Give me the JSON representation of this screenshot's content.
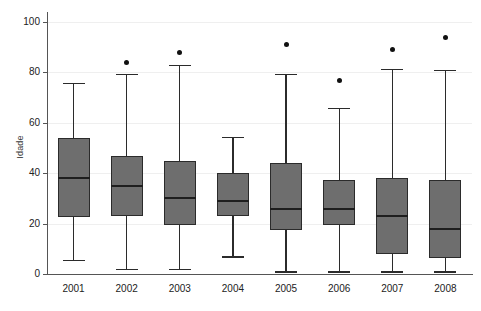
{
  "chart_data": {
    "type": "box",
    "title": "",
    "xlabel": "",
    "ylabel": "Idade",
    "categories": [
      "2001",
      "2002",
      "2003",
      "2004",
      "2005",
      "2006",
      "2007",
      "2008"
    ],
    "ylim": [
      0,
      104
    ],
    "ytick_labels": [
      "0",
      "20",
      "40",
      "60",
      "80",
      "100"
    ],
    "ytick_values": [
      0,
      20,
      40,
      60,
      80,
      100
    ],
    "grid": true,
    "grid_axis": "y",
    "legend": "none",
    "box_color": "#6e6e6e",
    "line_color": "#2b2b2b",
    "outlier_color": "#111111",
    "boxes": [
      {
        "category": "2001",
        "whisker_low": 5.5,
        "q1": 22.5,
        "median": 38.0,
        "q3": 54.0,
        "whisker_high": 76.0,
        "outliers": []
      },
      {
        "category": "2002",
        "whisker_low": 2.0,
        "q1": 23.0,
        "median": 35.0,
        "q3": 47.0,
        "whisker_high": 79.5,
        "outliers": [
          84.0
        ]
      },
      {
        "category": "2003",
        "whisker_low": 2.0,
        "q1": 19.5,
        "median": 30.0,
        "q3": 45.0,
        "whisker_high": 83.0,
        "outliers": [
          88.0
        ]
      },
      {
        "category": "2004",
        "whisker_low": 7.0,
        "q1": 23.0,
        "median": 29.0,
        "q3": 40.0,
        "whisker_high": 54.5,
        "outliers": []
      },
      {
        "category": "2005",
        "whisker_low": 1.0,
        "q1": 17.5,
        "median": 26.0,
        "q3": 44.0,
        "whisker_high": 79.5,
        "outliers": [
          91.0
        ]
      },
      {
        "category": "2006",
        "whisker_low": 1.0,
        "q1": 19.5,
        "median": 26.0,
        "q3": 37.5,
        "whisker_high": 66.0,
        "outliers": [
          77.0
        ]
      },
      {
        "category": "2007",
        "whisker_low": 1.0,
        "q1": 8.0,
        "median": 23.0,
        "q3": 38.0,
        "whisker_high": 81.5,
        "outliers": [
          89.0
        ]
      },
      {
        "category": "2008",
        "whisker_low": 1.0,
        "q1": 6.5,
        "median": 18.0,
        "q3": 37.5,
        "whisker_high": 81.0,
        "outliers": [
          94.0
        ]
      }
    ]
  }
}
